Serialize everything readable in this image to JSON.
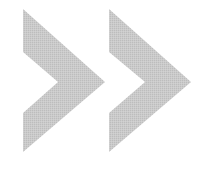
{
  "image": {
    "width": 203,
    "height": 176,
    "background": "#ffffff",
    "icon": "double-chevron-right-icon",
    "fill_color": "#c6c6c6",
    "chevrons": [
      {
        "name": "chevron-right-icon-1",
        "points": "23,9 105,82 23,152 23,113 58,82 23,52"
      },
      {
        "name": "chevron-right-icon-2",
        "points": "109,9 191,82 109,152 109,113 145,82 109,52"
      }
    ]
  }
}
